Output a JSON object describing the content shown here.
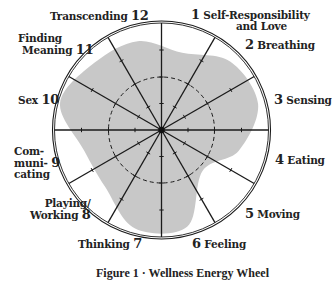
{
  "diagram": {
    "type": "wellness-wheel",
    "center": [
      161.5,
      130
    ],
    "outer_radius": 107,
    "scale_rings": [
      26.5,
      53,
      80,
      107
    ],
    "dashed_ring_radius": 53,
    "colors": {
      "shading": "#c8c8c8",
      "lines": "#1a1a1a",
      "text": "#222222",
      "background": "#ffffff"
    },
    "segments": [
      {
        "number": "1",
        "label": "Self-Responsibility and Love",
        "line1": "Self-Responsibility",
        "line2": "and Love",
        "shaded_radius": 80
      },
      {
        "number": "2",
        "label": "Breathing",
        "shaded_radius": 97
      },
      {
        "number": "3",
        "label": "Sensing",
        "shaded_radius": 100
      },
      {
        "number": "4",
        "label": "Eating",
        "shaded_radius": 80
      },
      {
        "number": "5",
        "label": "Moving",
        "shaded_radius": 58
      },
      {
        "number": "6",
        "label": "Feeling",
        "shaded_radius": 100
      },
      {
        "number": "7",
        "label": "Thinking",
        "shaded_radius": 102
      },
      {
        "number": "8",
        "label": "Playing/ Working",
        "line1": "Playing/",
        "line2": "Working",
        "shaded_radius": 80
      },
      {
        "number": "9",
        "label": "Communicating",
        "line1": "Com-",
        "line2": "muni-",
        "line3": "cating",
        "shaded_radius": 80
      },
      {
        "number": "10",
        "label": "Sex",
        "shaded_radius": 105
      },
      {
        "number": "11",
        "label": "Finding Meaning",
        "line1": "Finding",
        "line2": "Meaning",
        "shaded_radius": 95
      },
      {
        "number": "12",
        "label": "Transcending",
        "shaded_radius": 92
      }
    ]
  },
  "caption": "Figure 1 · Wellness Energy Wheel"
}
